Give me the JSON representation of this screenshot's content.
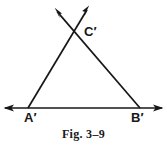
{
  "figure": {
    "caption": "Fig. 3–9",
    "background_color": "#ffffff",
    "ink_color": "#171717",
    "width": 167,
    "height": 150
  },
  "labels": {
    "apex": "C′",
    "left_vertex": "A′",
    "right_vertex": "B′"
  },
  "geometry": {
    "type": "line-diagram",
    "description": "Triangle-like figure formed by two rays crossing above the apex and a horizontal base line with arrowheads at both ends",
    "points": {
      "A_prime": {
        "x": 28,
        "y": 108
      },
      "B_prime": {
        "x": 140,
        "y": 108
      },
      "C_prime": {
        "x": 74,
        "y": 30
      }
    },
    "segments": [
      {
        "name": "base-line",
        "from": {
          "x": 5,
          "y": 108
        },
        "to": {
          "x": 162,
          "y": 108
        },
        "arrow_start": true,
        "arrow_end": true
      },
      {
        "name": "left-ray",
        "from": {
          "x": 28,
          "y": 108
        },
        "to": {
          "x": 88,
          "y": 8
        },
        "arrow_start": false,
        "arrow_end": true
      },
      {
        "name": "right-ray",
        "from": {
          "x": 140,
          "y": 108
        },
        "to": {
          "x": 56,
          "y": 10
        },
        "arrow_start": false,
        "arrow_end": true
      }
    ]
  }
}
